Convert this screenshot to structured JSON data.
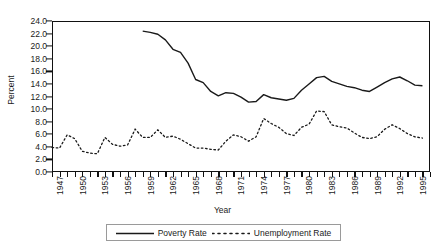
{
  "chart_data": {
    "type": "line",
    "title": "",
    "xlabel": "Year",
    "ylabel": "Percent",
    "ylim": [
      0.0,
      24.0
    ],
    "ytick_step": 2.0,
    "yticks": [
      "0.0",
      "2.0",
      "4.0",
      "6.0",
      "8.0",
      "10.0",
      "12.0",
      "14.0",
      "16.0",
      "18.0",
      "20.0",
      "22.0",
      "24.0"
    ],
    "xlim": [
      1947,
      1997
    ],
    "xtick_labels": [
      "1947",
      "1950",
      "1953",
      "1956",
      "1959",
      "1962",
      "1965",
      "1968",
      "1971",
      "1974",
      "1977",
      "1980",
      "1983",
      "1986",
      "1989",
      "1992",
      "1995"
    ],
    "xtick_label_step": 3,
    "xtick_minor_step": 1,
    "grid": false,
    "legend_position": "below-axes",
    "series": [
      {
        "name": "Poverty Rate",
        "style": "solid",
        "color": "#1a1a1a",
        "x": [
          1959,
          1960,
          1961,
          1962,
          1963,
          1964,
          1965,
          1966,
          1967,
          1968,
          1969,
          1970,
          1971,
          1972,
          1973,
          1974,
          1975,
          1976,
          1977,
          1978,
          1979,
          1980,
          1981,
          1982,
          1983,
          1984,
          1985,
          1986,
          1987,
          1988,
          1989,
          1990,
          1991,
          1992,
          1993,
          1994,
          1995,
          1996
        ],
        "values": [
          22.4,
          22.2,
          21.9,
          21.0,
          19.5,
          19.0,
          17.3,
          14.7,
          14.2,
          12.8,
          12.1,
          12.6,
          12.5,
          11.9,
          11.1,
          11.2,
          12.3,
          11.8,
          11.6,
          11.4,
          11.7,
          13.0,
          14.0,
          15.0,
          15.2,
          14.4,
          14.0,
          13.6,
          13.4,
          13.0,
          12.8,
          13.5,
          14.2,
          14.8,
          15.1,
          14.5,
          13.8,
          13.7
        ]
      },
      {
        "name": "Unemployment Rate",
        "style": "dotted",
        "color": "#1a1a1a",
        "x": [
          1947,
          1948,
          1949,
          1950,
          1951,
          1952,
          1953,
          1954,
          1955,
          1956,
          1957,
          1958,
          1959,
          1960,
          1961,
          1962,
          1963,
          1964,
          1965,
          1966,
          1967,
          1968,
          1969,
          1970,
          1971,
          1972,
          1973,
          1974,
          1975,
          1976,
          1977,
          1978,
          1979,
          1980,
          1981,
          1982,
          1983,
          1984,
          1985,
          1986,
          1987,
          1988,
          1989,
          1990,
          1991,
          1992,
          1993,
          1994,
          1995,
          1996
        ],
        "values": [
          3.9,
          3.8,
          5.9,
          5.3,
          3.3,
          3.0,
          2.9,
          5.5,
          4.4,
          4.1,
          4.3,
          6.8,
          5.5,
          5.5,
          6.7,
          5.5,
          5.7,
          5.2,
          4.5,
          3.8,
          3.8,
          3.6,
          3.5,
          4.9,
          5.9,
          5.6,
          4.9,
          5.6,
          8.5,
          7.7,
          7.1,
          6.1,
          5.8,
          7.1,
          7.6,
          9.7,
          9.6,
          7.5,
          7.2,
          7.0,
          6.2,
          5.5,
          5.3,
          5.6,
          6.8,
          7.5,
          6.9,
          6.1,
          5.6,
          5.4
        ]
      }
    ]
  },
  "legend": {
    "entries": [
      {
        "label": "Poverty Rate",
        "style": "solid"
      },
      {
        "label": "Unemployment Rate",
        "style": "dotted"
      }
    ]
  }
}
